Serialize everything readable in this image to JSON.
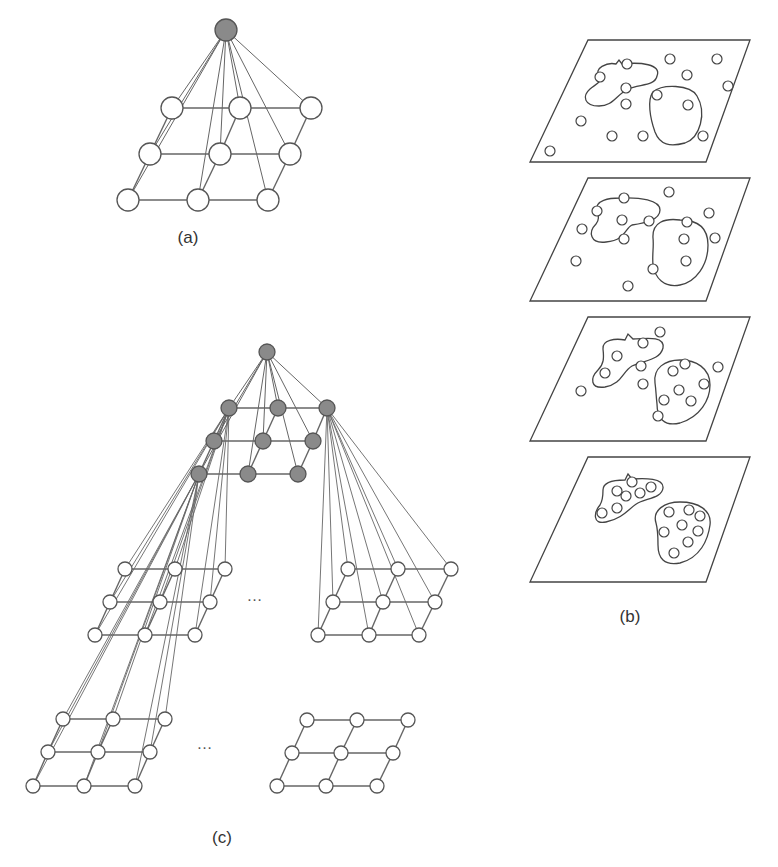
{
  "figure": {
    "panels": [
      {
        "id": "a",
        "label": "(a)",
        "description": "Single pyramid: one root node connected to all nodes of a 3x3 grid"
      },
      {
        "id": "b",
        "label": "(b)",
        "description": "Stack of four planes showing points progressively clustering into two regions"
      },
      {
        "id": "c",
        "label": "(c)",
        "description": "Hierarchical pyramid: root node over gray 3x3 grid, each gray node fanning out to lower 3x3 grids"
      }
    ],
    "ellipsis": "…",
    "colors": {
      "stroke": "#555555",
      "filled_node": "#8a8a8a",
      "open_node": "#ffffff",
      "edge": "#666666"
    }
  },
  "panel_a": {
    "label": "(a)",
    "label_pos": [
      188,
      243
    ],
    "root": {
      "x": 226,
      "y": 30,
      "r": 11
    },
    "node_r": 11,
    "grid": [
      [
        [
          172,
          108
        ],
        [
          240,
          108
        ],
        [
          311,
          108
        ]
      ],
      [
        [
          150,
          154
        ],
        [
          220,
          154
        ],
        [
          290,
          154
        ]
      ],
      [
        [
          128,
          200
        ],
        [
          198,
          200
        ],
        [
          268,
          200
        ]
      ]
    ]
  },
  "panel_c": {
    "label": "(c)",
    "label_pos": [
      222,
      843
    ],
    "root": {
      "x": 267,
      "y": 352,
      "r": 8
    },
    "gray_r": 8,
    "open_r": 7,
    "gray_grid": [
      [
        [
          229,
          408
        ],
        [
          278,
          408
        ],
        [
          327,
          408
        ]
      ],
      [
        [
          214,
          441
        ],
        [
          263,
          441
        ],
        [
          313,
          441
        ]
      ],
      [
        [
          199,
          474
        ],
        [
          248,
          474
        ],
        [
          298,
          474
        ]
      ]
    ],
    "sub_grids": [
      {
        "name": "left-mid",
        "parent": [
          229,
          408
        ],
        "nodes": [
          [
            [
              125,
              569
            ],
            [
              175,
              569
            ],
            [
              225,
              569
            ]
          ],
          [
            [
              110,
              602
            ],
            [
              160,
              602
            ],
            [
              210,
              602
            ]
          ],
          [
            [
              95,
              635
            ],
            [
              145,
              635
            ],
            [
              195,
              635
            ]
          ]
        ]
      },
      {
        "name": "right-mid",
        "parent": [
          327,
          408
        ],
        "nodes": [
          [
            [
              348,
              569
            ],
            [
              398,
              569
            ],
            [
              451,
              569
            ]
          ],
          [
            [
              333,
              602
            ],
            [
              383,
              602
            ],
            [
              435,
              602
            ]
          ],
          [
            [
              318,
              635
            ],
            [
              369,
              635
            ],
            [
              419,
              635
            ]
          ]
        ]
      },
      {
        "name": "bottom-left",
        "parent": [
          199,
          474
        ],
        "nodes": [
          [
            [
              63,
              719
            ],
            [
              113,
              719
            ],
            [
              165,
              719
            ]
          ],
          [
            [
              48,
              752
            ],
            [
              98,
              752
            ],
            [
              150,
              752
            ]
          ],
          [
            [
              33,
              786
            ],
            [
              84,
              786
            ],
            [
              135,
              786
            ]
          ]
        ]
      },
      {
        "name": "bottom-right",
        "parent": null,
        "nodes": [
          [
            [
              307,
              720
            ],
            [
              357,
              720
            ],
            [
              408,
              720
            ]
          ],
          [
            [
              292,
              753
            ],
            [
              341,
              753
            ],
            [
              393,
              753
            ]
          ],
          [
            [
              277,
              786
            ],
            [
              326,
              786
            ],
            [
              377,
              786
            ]
          ]
        ]
      }
    ],
    "ellipses": [
      [
        255,
        601
      ],
      [
        205,
        749
      ]
    ]
  },
  "panel_b": {
    "label": "(b)",
    "label_pos": [
      630,
      622
    ],
    "point_r": 5,
    "planes": [
      {
        "poly": [
          [
            588,
            40
          ],
          [
            750,
            40
          ],
          [
            706,
            162
          ],
          [
            530,
            162
          ]
        ],
        "blobs": [
          "M600,77 C592,68 608,62 616,64 L619,60 L622,64 C640,62 662,64 657,76 C655,86 640,84 628,89 C615,96 613,106 599,106 C584,106 582,96 590,89 C596,84 602,82 600,77 Z",
          "M653,92 C662,84 690,84 697,96 C707,113 700,138 685,143 C670,147 660,145 655,132 C650,118 647,100 653,92 Z"
        ],
        "points": [
          [
            627,
            64
          ],
          [
            600,
            77
          ],
          [
            626,
            88
          ],
          [
            670,
            59
          ],
          [
            717,
            59
          ],
          [
            687,
            75
          ],
          [
            728,
            86
          ],
          [
            626,
            104
          ],
          [
            657,
            95
          ],
          [
            688,
            105
          ],
          [
            581,
            121
          ],
          [
            612,
            136
          ],
          [
            643,
            136
          ],
          [
            703,
            136
          ],
          [
            550,
            151
          ]
        ]
      },
      {
        "poly": [
          [
            588,
            178
          ],
          [
            750,
            178
          ],
          [
            706,
            301
          ],
          [
            530,
            301
          ]
        ],
        "blobs": [
          "M597,211 C594,200 610,198 620,198 C640,197 660,200 660,210 C660,220 645,223 632,225 C625,228 626,240 606,242 C590,244 588,232 596,224 C600,219 598,215 597,211 Z",
          "M653,238 C652,222 665,218 680,220 C695,220 708,225 708,245 C708,265 696,282 680,285 C664,288 655,278 653,265 C652,255 654,246 653,238 Z"
        ],
        "points": [
          [
            624,
            198
          ],
          [
            597,
            211
          ],
          [
            622,
            220
          ],
          [
            649,
            221
          ],
          [
            669,
            192
          ],
          [
            709,
            213
          ],
          [
            582,
            229
          ],
          [
            624,
            239
          ],
          [
            687,
            222
          ],
          [
            684,
            239
          ],
          [
            715,
            238
          ],
          [
            576,
            261
          ],
          [
            686,
            261
          ],
          [
            653,
            269
          ],
          [
            628,
            286
          ]
        ]
      },
      {
        "poly": [
          [
            588,
            317
          ],
          [
            750,
            317
          ],
          [
            706,
            441
          ],
          [
            530,
            441
          ]
        ],
        "blobs": [
          "M603,349 C602,340 615,338 625,340 L628,334 L633,339 C648,338 665,336 663,348 C660,360 645,360 632,366 C622,372 622,384 605,387 C590,389 590,378 598,370 C604,364 604,358 603,349 Z",
          "M655,383 C653,368 665,360 680,360 C696,360 710,368 710,385 C710,400 700,417 680,423 C664,427 657,418 657,404 C656,395 656,390 655,383 Z"
        ],
        "points": [
          [
            660,
            332
          ],
          [
            643,
            343
          ],
          [
            617,
            356
          ],
          [
            641,
            366
          ],
          [
            605,
            373
          ],
          [
            643,
            384
          ],
          [
            581,
            391
          ],
          [
            685,
            364
          ],
          [
            673,
            371
          ],
          [
            718,
            367
          ],
          [
            704,
            384
          ],
          [
            679,
            390
          ],
          [
            664,
            400
          ],
          [
            691,
            401
          ],
          [
            658,
            416
          ]
        ]
      },
      {
        "poly": [
          [
            588,
            457
          ],
          [
            750,
            457
          ],
          [
            706,
            582
          ],
          [
            530,
            582
          ]
        ],
        "blobs": [
          "M603,490 C603,481 615,480 625,480 L628,474 L632,479 C645,478 664,478 663,488 C662,497 650,498 640,502 C630,506 625,518 606,522 C592,525 594,512 600,505 C603,500 603,495 603,490 Z",
          "M656,523 C652,510 665,502 680,502 C698,502 712,510 710,525 C708,540 700,558 680,563 C664,566 658,558 658,545 C658,535 658,530 656,523 Z"
        ],
        "points": [
          [
            632,
            482
          ],
          [
            617,
            491
          ],
          [
            651,
            487
          ],
          [
            626,
            496
          ],
          [
            640,
            493
          ],
          [
            602,
            513
          ],
          [
            617,
            508
          ],
          [
            669,
            512
          ],
          [
            689,
            510
          ],
          [
            700,
            516
          ],
          [
            682,
            525
          ],
          [
            664,
            532
          ],
          [
            698,
            531
          ],
          [
            688,
            542
          ],
          [
            674,
            553
          ]
        ]
      }
    ]
  }
}
